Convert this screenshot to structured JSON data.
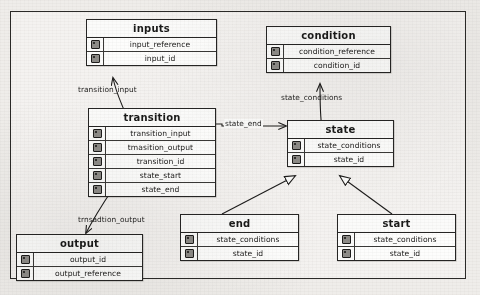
{
  "diagram": {
    "key_icon": "key-icon",
    "entities": [
      {
        "id": "inputs",
        "name": "inputs",
        "attributes": [
          {
            "key": "key-icon",
            "name": "input_reference"
          },
          {
            "key": "key-icon",
            "name": "input_id"
          }
        ]
      },
      {
        "id": "condition",
        "name": "condition",
        "attributes": [
          {
            "key": "key-icon",
            "name": "condition_reference"
          },
          {
            "key": "key-icon",
            "name": "condition_id"
          }
        ]
      },
      {
        "id": "transition",
        "name": "transition",
        "attributes": [
          {
            "key": "key-icon",
            "name": "transition_input"
          },
          {
            "key": "key-icon",
            "name": "tmasition_output"
          },
          {
            "key": "key-icon",
            "name": "transition_id"
          },
          {
            "key": "key-icon",
            "name": "state_start"
          },
          {
            "key": "key-icon",
            "name": "state_end"
          }
        ]
      },
      {
        "id": "state",
        "name": "state",
        "attributes": [
          {
            "key": "key-icon",
            "name": "state_conditions"
          },
          {
            "key": "key-icon",
            "name": "state_id"
          }
        ]
      },
      {
        "id": "end",
        "name": "end",
        "attributes": [
          {
            "key": "key-icon",
            "name": "state_conditions"
          },
          {
            "key": "key-icon",
            "name": "state_id"
          }
        ]
      },
      {
        "id": "start",
        "name": "start",
        "attributes": [
          {
            "key": "key-icon",
            "name": "state_conditions"
          },
          {
            "key": "key-icon",
            "name": "state_id"
          }
        ]
      },
      {
        "id": "output",
        "name": "output",
        "attributes": [
          {
            "key": "key-icon",
            "name": "output_id"
          },
          {
            "key": "key-icon",
            "name": "output_reference"
          }
        ]
      }
    ],
    "relationships": [
      {
        "id": "transition_input",
        "label": "transition_input",
        "from": "transition",
        "to": "inputs"
      },
      {
        "id": "state_conditions",
        "label": "state_conditions",
        "from": "state",
        "to": "condition"
      },
      {
        "id": "state_end",
        "label": "state_end",
        "from": "transition",
        "to": "state"
      },
      {
        "id": "transition_output",
        "label": "trnsadtion_output",
        "from": "transition",
        "to": "output"
      },
      {
        "id": "end_is_a_state",
        "label": "",
        "from": "end",
        "to": "state"
      },
      {
        "id": "start_is_a_state",
        "label": "",
        "from": "start",
        "to": "state"
      }
    ]
  }
}
